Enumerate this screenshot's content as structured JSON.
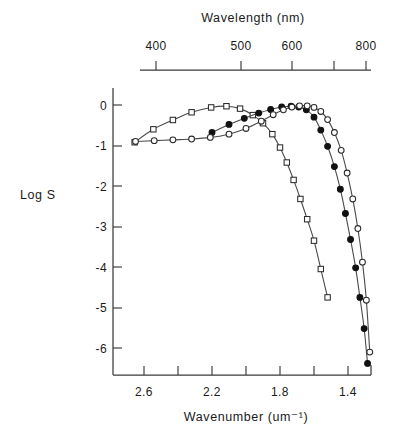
{
  "chart_data": {
    "type": "line",
    "title": "",
    "xlabel": "Wavenumber (um⁻¹)",
    "xlabel_top": "Wavelength (nm)",
    "ylabel": "Log S",
    "xlim": [
      2.72,
      1.24
    ],
    "ylim": [
      -6.85,
      0.35
    ],
    "grid": false,
    "legend": "none",
    "x_ticks_major": [
      2.6,
      2.2,
      1.8,
      1.4
    ],
    "x_ticks_minor": [
      2.4,
      2.0,
      1.6,
      1.2
    ],
    "x_tick_labels": [
      "2.6",
      "2.2",
      "1.8",
      "1.4"
    ],
    "y_ticks": [
      0,
      -1,
      -2,
      -3,
      -4,
      -5,
      -6
    ],
    "y_tick_labels": [
      "0",
      "-1",
      "-2",
      "-3",
      "-4",
      "-5",
      "-6"
    ],
    "top_axis_ticks_nm": [
      400,
      500,
      600,
      700,
      800
    ],
    "top_axis_tick_labels": [
      "400",
      "500",
      "600",
      "",
      "800"
    ],
    "series": [
      {
        "name": "open-squares",
        "marker": "open-square",
        "x": [
          2.655,
          2.545,
          2.43,
          2.32,
          2.205,
          2.115,
          2.035,
          1.96,
          1.9,
          1.845,
          1.8,
          1.76,
          1.72,
          1.68,
          1.64,
          1.6,
          1.56,
          1.52
        ],
        "y": [
          -0.92,
          -0.6,
          -0.37,
          -0.18,
          -0.06,
          -0.03,
          -0.09,
          -0.25,
          -0.45,
          -0.72,
          -1.05,
          -1.42,
          -1.85,
          -2.32,
          -2.82,
          -3.35,
          -4.05,
          -4.75
        ]
      },
      {
        "name": "filled-circles",
        "marker": "filled-circle",
        "x": [
          2.2,
          2.1,
          2.01,
          1.925,
          1.855,
          1.79,
          1.735,
          1.69,
          1.645,
          1.6,
          1.56,
          1.52,
          1.48,
          1.445,
          1.415,
          1.385,
          1.355,
          1.33,
          1.305,
          1.285
        ],
        "y": [
          -0.68,
          -0.48,
          -0.33,
          -0.2,
          -0.11,
          -0.05,
          -0.03,
          -0.05,
          -0.12,
          -0.3,
          -0.62,
          -1.02,
          -1.52,
          -2.08,
          -2.68,
          -3.32,
          -4.02,
          -4.75,
          -5.52,
          -6.38
        ]
      },
      {
        "name": "open-circles",
        "marker": "open-circle",
        "x": [
          2.65,
          2.54,
          2.43,
          2.32,
          2.21,
          2.1,
          2.0,
          1.91,
          1.84,
          1.78,
          1.73,
          1.685,
          1.64,
          1.6,
          1.56,
          1.52,
          1.48,
          1.44,
          1.405,
          1.372,
          1.342,
          1.315,
          1.292,
          1.272
        ],
        "y": [
          -0.9,
          -0.88,
          -0.86,
          -0.84,
          -0.8,
          -0.72,
          -0.58,
          -0.4,
          -0.24,
          -0.12,
          -0.05,
          -0.02,
          -0.02,
          -0.06,
          -0.16,
          -0.36,
          -0.68,
          -1.12,
          -1.68,
          -2.32,
          -3.05,
          -3.88,
          -4.82,
          -6.1
        ]
      }
    ]
  }
}
